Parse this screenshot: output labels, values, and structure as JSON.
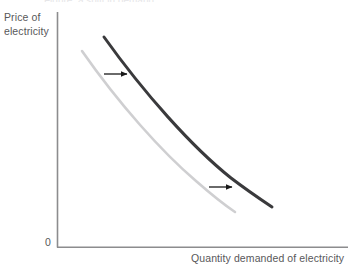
{
  "figure": {
    "title_cut_off": "Figure: a shift in demand",
    "background_color": "#ffffff",
    "axis_color": "#8c8c8e",
    "text_color": "#58585a",
    "origin_label": "0"
  },
  "axes": {
    "y_label_line1": "Price of",
    "y_label_line2": "electricity",
    "x_label": "Quantity demanded of electricity"
  },
  "curves": [
    {
      "name": "original-demand-curve",
      "color": "#cfcfd1",
      "width": 2.6,
      "path": "M 82 51 C 119 104, 162 152, 196 181 C 212 195, 226 206, 235 212"
    },
    {
      "name": "shifted-demand-curve",
      "color": "#3a3a3c",
      "width": 3.0,
      "path": "M 104 37 C 144 93, 192 147, 231 178 C 248 191, 263 201, 272 207"
    }
  ],
  "arrows": [
    {
      "name": "upper-shift-arrow",
      "color": "#1a1a1a",
      "x1": 104,
      "y1": 74,
      "x2": 128,
      "y2": 74
    },
    {
      "name": "lower-shift-arrow",
      "color": "#1a1a1a",
      "x1": 209,
      "y1": 187,
      "x2": 233,
      "y2": 187
    }
  ],
  "chart_data": {
    "type": "line",
    "title": "",
    "xlabel": "Quantity demanded of electricity",
    "ylabel": "Price of electricity",
    "grid": false,
    "legend": "none",
    "axis_ticks": [
      "0"
    ],
    "annotations": [
      "rightward arrow (upper)",
      "rightward arrow (lower)"
    ],
    "series": [
      {
        "name": "Original demand",
        "color": "#cfcfd1",
        "x": [
          0.09,
          0.25,
          0.41,
          0.57,
          0.63
        ],
        "y": [
          0.89,
          0.68,
          0.45,
          0.26,
          0.19
        ]
      },
      {
        "name": "Shifted demand",
        "color": "#3a3a3c",
        "x": [
          0.17,
          0.33,
          0.5,
          0.68,
          0.75
        ],
        "y": [
          0.95,
          0.74,
          0.51,
          0.31,
          0.21
        ]
      }
    ]
  }
}
